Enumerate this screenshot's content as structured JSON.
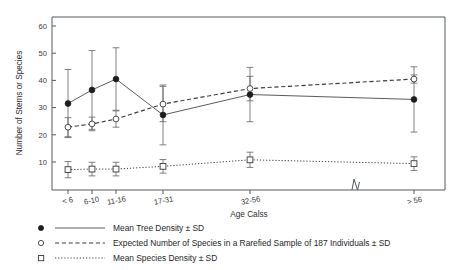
{
  "chart_data": {
    "type": "line",
    "title": "",
    "xlabel": "Age Calss",
    "ylabel": "Number of Stems or Species",
    "categories": [
      "< 6",
      "6-10",
      "11-16",
      "17-31",
      "32-56",
      "> 56"
    ],
    "x_positions": [
      68,
      92,
      116,
      163,
      250,
      414
    ],
    "x_axis_break": {
      "present": true,
      "position_px": 356
    },
    "ylim": [
      0,
      64
    ],
    "yticks": [
      10,
      20,
      30,
      40,
      50,
      60
    ],
    "ytick_labels": [
      "10",
      "20",
      "30",
      "40",
      "50",
      "60"
    ],
    "grid": false,
    "legend_position": "below-plot",
    "series": [
      {
        "name": "Mean Tree Density ± SD",
        "marker": "filled-circle",
        "line_style": "solid",
        "values": [
          31.5,
          36.5,
          40.5,
          27.3,
          34.8,
          33.0
        ],
        "errors": [
          12.5,
          14.5,
          11.5,
          11.0,
          10.0,
          12.0
        ]
      },
      {
        "name": "Expected Number of Species in a Rarefied Sample of 187 Individuals ± SD",
        "marker": "open-circle",
        "line_style": "dashed",
        "values": [
          22.8,
          24.0,
          25.8,
          31.3,
          37.0,
          40.5
        ],
        "errors": [
          3.5,
          2.5,
          3.0,
          6.5,
          4.5,
          1.5
        ]
      },
      {
        "name": "Mean Species Density ± SD",
        "marker": "open-square",
        "line_style": "dotted",
        "values": [
          7.2,
          7.4,
          7.4,
          8.4,
          10.8,
          9.4
        ],
        "errors": [
          3.0,
          2.5,
          2.5,
          2.5,
          2.8,
          2.5
        ]
      }
    ]
  },
  "axes": {
    "y_title": "Number of Stems or Species",
    "x_title": "Age Calss",
    "y_tick_labels": [
      "60",
      "50",
      "40",
      "30",
      "20",
      "10"
    ],
    "x_tick_labels": [
      "< 6",
      "6-10",
      "11-16",
      "17-31",
      "32-56",
      "> 56"
    ]
  },
  "legend": {
    "entries": [
      {
        "label": "Mean Tree Density ± SD",
        "marker": "filled-circle",
        "line": "solid"
      },
      {
        "label": "Expected Number of Species in a Rarefied Sample of 187 Individuals ± SD",
        "marker": "open-circle",
        "line": "dashed"
      },
      {
        "label": "Mean Species Density ± SD",
        "marker": "open-square",
        "line": "dotted"
      }
    ]
  },
  "colors": {
    "background": "#ffffff",
    "axis": "#555a5e",
    "line_tree_density": "#4a4a4a",
    "line_expected_species": "#3d3d3d",
    "line_species_density": "#3d3d3d",
    "marker_filled": "#1d1d1d",
    "text": "#262626"
  }
}
